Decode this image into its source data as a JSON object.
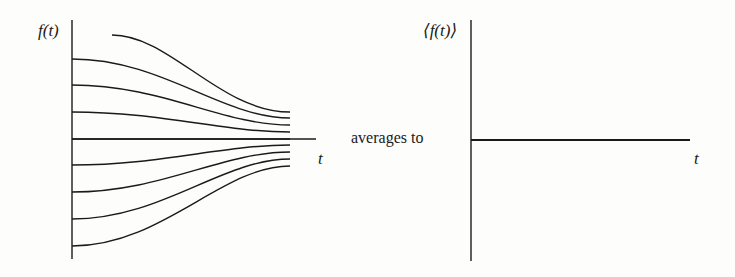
{
  "figure": {
    "left_panel": {
      "y_label": "f(t)",
      "x_label": "t",
      "curves": [
        {
          "start_y": 35,
          "end_y": 112
        },
        {
          "start_y": 59,
          "end_y": 118
        },
        {
          "start_y": 85,
          "end_y": 125
        },
        {
          "start_y": 112,
          "end_y": 132
        },
        {
          "start_y": 139,
          "end_y": 139
        },
        {
          "start_y": 165,
          "end_y": 145
        },
        {
          "start_y": 192,
          "end_y": 152
        },
        {
          "start_y": 219,
          "end_y": 159
        },
        {
          "start_y": 246,
          "end_y": 166
        }
      ]
    },
    "connector_text": "averages to",
    "right_panel": {
      "y_label": "⟨f(t)⟩",
      "x_label": "t"
    },
    "colors": {
      "ink": "#1a1a1a",
      "paper": "#fdfdfb",
      "show_through": "#e6e6e3"
    }
  }
}
